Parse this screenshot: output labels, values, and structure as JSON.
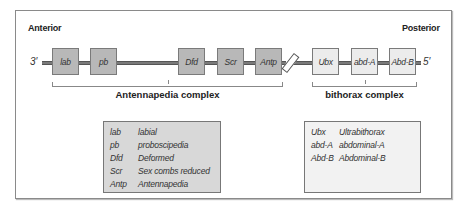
{
  "orientation": {
    "left": "Anterior",
    "right": "Posterior"
  },
  "strand_ends": {
    "left": "3′",
    "right": "5′"
  },
  "genes": {
    "antennapedia": [
      "lab",
      "pb",
      "Dfd",
      "Scr",
      "Antp"
    ],
    "bithorax": [
      "Ubx",
      "abd-A",
      "Abd-B"
    ]
  },
  "complexes": {
    "antennapedia": "Antennapedia complex",
    "bithorax": "bithorax complex"
  },
  "legend": {
    "antennapedia": [
      {
        "abbr": "lab",
        "name": "labial"
      },
      {
        "abbr": "pb",
        "name": "proboscipedia"
      },
      {
        "abbr": "Dfd",
        "name": "Deformed"
      },
      {
        "abbr": "Scr",
        "name": "Sex combs reduced"
      },
      {
        "abbr": "Antp",
        "name": "Antennapedia"
      }
    ],
    "bithorax": [
      {
        "abbr": "Ubx",
        "name": "Ultrabithorax"
      },
      {
        "abbr": "abd-A",
        "name": "abdominal-A"
      },
      {
        "abbr": "Abd-B",
        "name": "Abdominal-B"
      }
    ]
  },
  "colors": {
    "antennapedia_fill": "#b8b8b8",
    "bithorax_fill": "#ececec",
    "dna": "#7a7a7a"
  }
}
